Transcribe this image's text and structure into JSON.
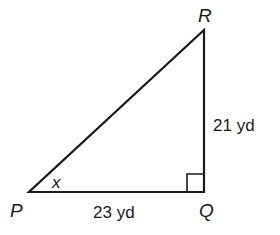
{
  "diagram": {
    "type": "right-triangle",
    "vertices": {
      "P": {
        "label": "P"
      },
      "Q": {
        "label": "Q"
      },
      "R": {
        "label": "R"
      }
    },
    "sides": {
      "QR": {
        "label": "21 yd"
      },
      "PQ": {
        "label": "23 yd"
      }
    },
    "angle": {
      "vertex": "P",
      "label": "x"
    },
    "right_angle_at": "Q",
    "colors": {
      "stroke": "#1a1a1a",
      "background": "#ffffff"
    }
  }
}
